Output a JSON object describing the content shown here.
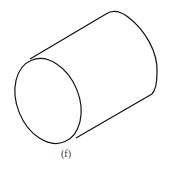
{
  "figure": {
    "shape": "cylinder",
    "view": "isometric",
    "caption": "(f)",
    "stroke_color": "#111111"
  }
}
